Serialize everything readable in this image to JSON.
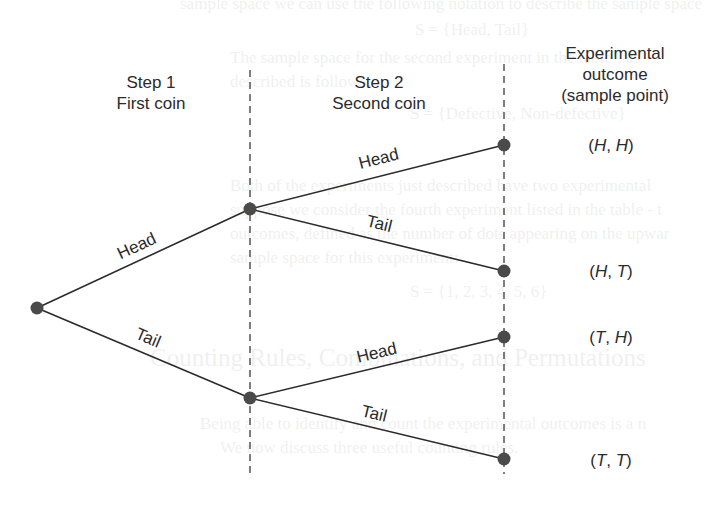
{
  "diagram": {
    "columns": {
      "step1": {
        "line1": "Step 1",
        "line2": "First coin"
      },
      "step2": {
        "line1": "Step 2",
        "line2": "Second coin"
      },
      "outcome": {
        "line1": "Experimental",
        "line2": "outcome",
        "line3": "(sample point)"
      }
    },
    "branches": {
      "root_head": "Head",
      "root_tail": "Tail",
      "h_head": "Head",
      "h_tail": "Tail",
      "t_head": "Head",
      "t_tail": "Tail"
    },
    "outcomes": [
      {
        "first": "H",
        "second": "H",
        "text": "(H, H)"
      },
      {
        "first": "H",
        "second": "T",
        "text": "(H, T)"
      },
      {
        "first": "T",
        "second": "H",
        "text": "(T, H)"
      },
      {
        "first": "T",
        "second": "T",
        "text": "(T, T)"
      }
    ],
    "colors": {
      "line": "#2b2b2b",
      "node": "#4a4a4a",
      "dashed": "#3a3a3a",
      "background": "#ffffff"
    }
  },
  "background_bleed_text": {
    "line1": "sample space we can use the following notation to describe the sample space",
    "line2": "S = {Head, Tail}",
    "line3": "The sample space for the second experiment in the table - as",
    "line4": "described is follows:",
    "line5": "S = {Defective, Non-defective}",
    "line6": "Both of the experiments just described have two experimental",
    "line7": "suppose we consider the fourth experiment listed in the table - t",
    "line8": "outcomes, defined as the number of dots appearing on the upwar",
    "line9": "sample space for this experiment:",
    "line10": "S = {1, 2, 3, 4, 5, 6}",
    "heading": "Counting Rules, Combinations, and Permutations",
    "line11": "Being able to identify and count the experimental outcomes is a n",
    "line12": "We now discuss three useful counting rules."
  }
}
